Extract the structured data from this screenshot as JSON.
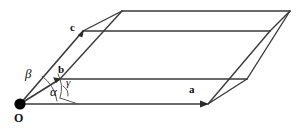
{
  "figure": {
    "kind": "crystal-unit-cell-diagram",
    "width": 302,
    "height": 129,
    "background_color": "#ffffff",
    "line_color": "#3a3a3a",
    "arc_color": "#555555",
    "text_color": "#111111",
    "origin_dot_color": "#000000"
  },
  "labels": {
    "origin": "O",
    "vector_a": "a",
    "vector_b": "b",
    "vector_c": "c",
    "angle_alpha": "α",
    "angle_beta": "β",
    "angle_gamma": "γ"
  },
  "geometry": {
    "origin": {
      "x": 20,
      "y": 104
    },
    "a_tip": {
      "x": 208,
      "y": 104
    },
    "b_tip": {
      "x": 60,
      "y": 79
    },
    "c_tip": {
      "x": 83,
      "y": 31
    },
    "a_plus_b": {
      "x": 247,
      "y": 79
    },
    "a_plus_c": {
      "x": 270,
      "y": 31
    },
    "b_plus_c": {
      "x": 122,
      "y": 11
    },
    "a_plus_b_plus_c": {
      "x": 290,
      "y": 11
    }
  },
  "label_positions": {
    "origin": {
      "left": 14,
      "top": 112
    },
    "vector_a": {
      "left": 189,
      "top": 84
    },
    "vector_b": {
      "left": 58,
      "top": 64
    },
    "vector_c": {
      "left": 70,
      "top": 22
    },
    "angle_alpha": {
      "left": 50,
      "top": 86
    },
    "angle_beta": {
      "left": 25,
      "top": 68
    },
    "angle_gamma": {
      "left": 66,
      "top": 78
    }
  },
  "arcs": {
    "alpha_between": [
      "b",
      "c"
    ],
    "beta_between": [
      "a",
      "c"
    ],
    "gamma_between": [
      "a",
      "b"
    ]
  }
}
